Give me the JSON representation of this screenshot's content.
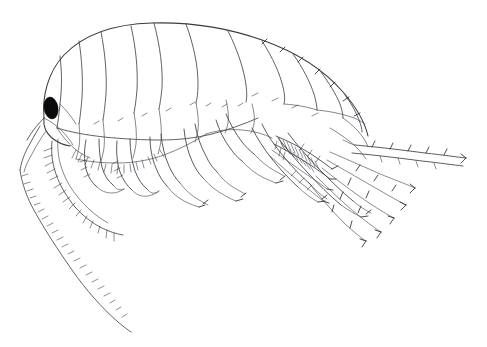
{
  "figure": {
    "kind": "scientific-line-drawing",
    "caption": "",
    "background_color": "#ffffff",
    "ink_color": "#2b2b30",
    "eye_color": "#0a0a0c",
    "canvas": {
      "width": 487,
      "height": 347
    },
    "orientation": "head at left, telson and uropods at right, body arched dorsally upward",
    "labels": [],
    "scale_bar": "",
    "anatomy": [
      {
        "name": "head",
        "region": "anterior-left"
      },
      {
        "name": "compound-eye",
        "region": "head",
        "color": "#0a0a0c",
        "shape": "oval"
      },
      {
        "name": "antenna-1",
        "region": "head",
        "note": "long, many-segmented, curving down and back"
      },
      {
        "name": "antenna-2",
        "region": "head",
        "note": "shorter, setose, curving downward"
      },
      {
        "name": "pereon-segments",
        "count": 7
      },
      {
        "name": "pleon-segments",
        "count": 3
      },
      {
        "name": "urosome-segments",
        "count": 3
      },
      {
        "name": "gnathopods",
        "count": 2
      },
      {
        "name": "pereopods",
        "count": 5
      },
      {
        "name": "pleopods",
        "count": 3,
        "note": "setose, hatched base"
      },
      {
        "name": "uropods",
        "count": 3,
        "note": "spinose, fanning posteriorly"
      },
      {
        "name": "telson",
        "region": "posterior"
      },
      {
        "name": "coxal-plates",
        "count": 7
      }
    ]
  }
}
